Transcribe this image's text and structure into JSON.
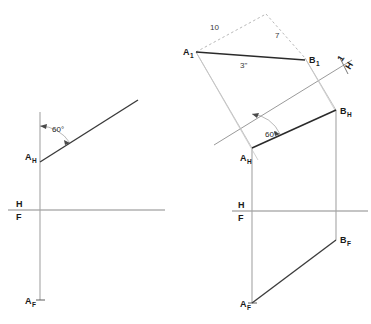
{
  "figure": {
    "background_color": "#ffffff",
    "ink_color": "#1a1a1a",
    "construction_color": "#a8a8a8",
    "width": 371,
    "height": 324
  },
  "left_view": {
    "name": "given-line-construction",
    "labels": {
      "a_h": "A",
      "a_h_sub": "H",
      "a_f": "A",
      "a_f_sub": "F",
      "fold_h": "H",
      "fold_f": "F",
      "angle": "60°"
    }
  },
  "right_view": {
    "name": "auxiliary-view-construction",
    "labels": {
      "a1": "A",
      "a1_sub": "1",
      "b1": "B",
      "b1_sub": "1",
      "a_h": "A",
      "a_h_sub": "H",
      "b_h": "B",
      "b_h_sub": "H",
      "a_f": "A",
      "a_f_sub": "F",
      "b_f": "B",
      "b_f_sub": "F",
      "fold_h": "H",
      "fold_f": "F",
      "fold_one": "1",
      "fold_one_h": "H",
      "angle": "60°"
    },
    "dimensions": {
      "side_left": "10",
      "side_right": "7",
      "base": "3\""
    }
  }
}
